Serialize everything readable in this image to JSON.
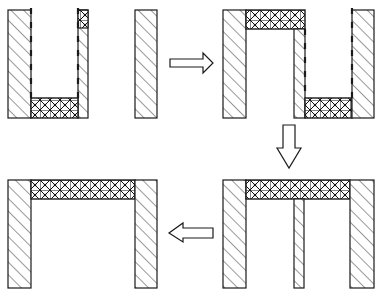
{
  "diagram": {
    "colors": {
      "stroke": "#1a1a1a",
      "fill": "#ffffff",
      "hatch": "#333333",
      "crosshatch": "#111111"
    },
    "legend": {
      "diagonal_hatch": "wall material",
      "cross_hatch": "fill material",
      "dashed_line": "liner"
    },
    "steps": [
      {
        "id": 1,
        "label": "Step 1: trench with bottom fill, separate wall"
      },
      {
        "id": 2,
        "label": "Step 2: fill bridges over narrow wall"
      },
      {
        "id": 3,
        "label": "Step 3: fill forms continuous top bridge"
      },
      {
        "id": 4,
        "label": "Step 4: final bridge structure"
      }
    ],
    "arrows": [
      {
        "from": 1,
        "to": 2,
        "direction": "right"
      },
      {
        "from": 2,
        "to": 3,
        "direction": "down"
      },
      {
        "from": 3,
        "to": 4,
        "direction": "left"
      }
    ]
  }
}
